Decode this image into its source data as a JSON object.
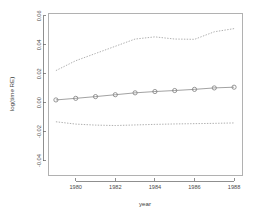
{
  "chart_data": {
    "type": "line",
    "title": "",
    "xlabel": "year",
    "ylabel": "log(time RE)",
    "xlim": [
      1978.6,
      1988.4
    ],
    "ylim": [
      -0.05,
      0.062
    ],
    "grid": false,
    "legend": "none",
    "x": [
      1979,
      1980,
      1981,
      1982,
      1983,
      1984,
      1985,
      1986,
      1987,
      1988
    ],
    "xticks": [
      1980,
      1982,
      1984,
      1986,
      1988
    ],
    "xticklabels": [
      "1980",
      "1982",
      "1984",
      "1986",
      "1988"
    ],
    "yticks": [
      0.06,
      0.04,
      0.02,
      0.0,
      -0.02,
      -0.04
    ],
    "yticklabels": [
      "0.06",
      "0.04",
      "0.02",
      "0.00",
      "-0.02",
      "-0.04"
    ],
    "series": [
      {
        "name": "estimate",
        "style": "solid-with-circle-markers",
        "color": "#8a8a8a",
        "values": [
          0.0019,
          0.003,
          0.0042,
          0.0055,
          0.0068,
          0.0077,
          0.0084,
          0.0092,
          0.0102,
          0.0107
        ]
      },
      {
        "name": "upper-confidence-band",
        "style": "dotted",
        "color": "#9a9a9a",
        "values": [
          0.0222,
          0.029,
          0.034,
          0.039,
          0.044,
          0.0455,
          0.044,
          0.0438,
          0.049,
          0.0512
        ]
      },
      {
        "name": "lower-confidence-band",
        "style": "dotted",
        "color": "#9a9a9a",
        "values": [
          -0.0132,
          -0.0148,
          -0.0155,
          -0.0158,
          -0.0154,
          -0.015,
          -0.0147,
          -0.0145,
          -0.0143,
          -0.014
        ]
      }
    ]
  },
  "axes": {
    "x_title": "year",
    "y_title": "log(time RE)"
  }
}
